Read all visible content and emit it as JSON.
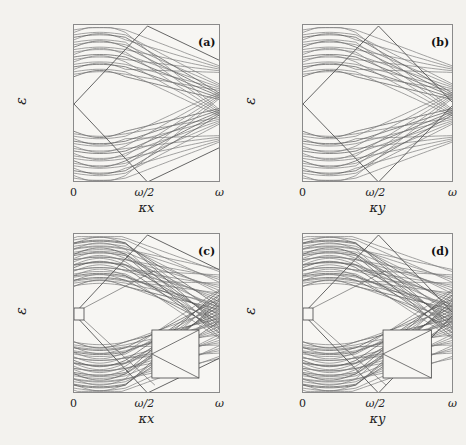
{
  "figure": {
    "panels": [
      {
        "id": "a",
        "label": "(a)",
        "xlabel": "κx",
        "ylabel": "ε",
        "inset": false
      },
      {
        "id": "b",
        "label": "(b)",
        "xlabel": "κy",
        "ylabel": "ε",
        "inset": false
      },
      {
        "id": "c",
        "label": "(c)",
        "xlabel": "κx",
        "ylabel": "ε",
        "inset": true
      },
      {
        "id": "d",
        "label": "(d)",
        "xlabel": "κy",
        "ylabel": "ε",
        "inset": true
      }
    ],
    "xticks": [
      "0",
      "ω/2",
      "ω"
    ],
    "yticks": [
      "ω/2",
      "0",
      "−ω/2"
    ]
  },
  "chart_data": [
    {
      "type": "line",
      "title": "(a)",
      "xlabel": "κx",
      "ylabel": "ε",
      "xlim": [
        "0",
        "ω"
      ],
      "ylim": [
        "−ω/2",
        "ω/2"
      ],
      "x_tick_labels": [
        "0",
        "ω/2",
        "ω"
      ],
      "y_tick_labels": [
        "−ω/2",
        "0",
        "ω/2"
      ],
      "description": "Quasienergy band structure: ~20 bands above and below zero, flat near κ=0, dispersing and crossing near κx≈0.8ω; a diamond-shaped pair of edge states from ε=0 at κ=0 to ±ω/2 at κ=ω/2.",
      "grid": false
    },
    {
      "type": "line",
      "title": "(b)",
      "xlabel": "κy",
      "ylabel": "ε",
      "xlim": [
        "0",
        "ω"
      ],
      "ylim": [
        "−ω/2",
        "ω/2"
      ],
      "x_tick_labels": [
        "0",
        "ω/2",
        "ω"
      ],
      "y_tick_labels": [
        "−ω/2",
        "0",
        "ω/2"
      ],
      "description": "Same as (a) vs κy; edge states form a full diamond: 0→±ω/2 at ω/2 → 0 at ω.",
      "grid": false
    },
    {
      "type": "line",
      "title": "(c)",
      "xlabel": "κx",
      "ylabel": "ε",
      "xlim": [
        "0",
        "ω"
      ],
      "ylim": [
        "−ω/2",
        "ω/2"
      ],
      "x_tick_labels": [
        "0",
        "ω/2",
        "ω"
      ],
      "y_tick_labels": [
        "−ω/2",
        "0",
        "ω/2"
      ],
      "description": "Denser band structure (~35 bands per half) with small box near (0,0) magnified in inset at lower right showing gap-crossing lines.",
      "inset": true,
      "grid": false
    },
    {
      "type": "line",
      "title": "(d)",
      "xlabel": "κy",
      "ylabel": "ε",
      "xlim": [
        "0",
        "ω"
      ],
      "ylim": [
        "−ω/2",
        "ω/2"
      ],
      "x_tick_labels": [
        "0",
        "ω/2",
        "ω"
      ],
      "y_tick_labels": [
        "−ω/2",
        "0",
        "ω/2"
      ],
      "description": "Same as (c) vs κy with magnified inset.",
      "inset": true,
      "grid": false
    }
  ],
  "layout": {
    "frames": [
      {
        "x": 73,
        "y": 24,
        "w": 147,
        "h": 158
      },
      {
        "x": 302,
        "y": 24,
        "w": 151,
        "h": 158
      },
      {
        "x": 73,
        "y": 233,
        "w": 147,
        "h": 160
      },
      {
        "x": 302,
        "y": 233,
        "w": 151,
        "h": 160
      }
    ],
    "bands": [
      20,
      20,
      34,
      34
    ],
    "line_color": "#7c7c7c",
    "dark_line_color": "#555555"
  }
}
